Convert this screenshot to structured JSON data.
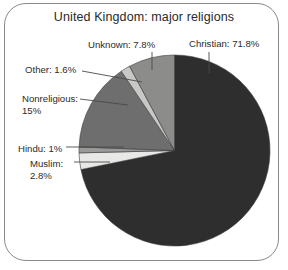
{
  "figure": {
    "frame": "rounded-rectangle-border",
    "background_color": "#ffffff",
    "border_color": "#8a8a86"
  },
  "chart_data": {
    "type": "pie",
    "title": "United Kingdom: major religions",
    "subtitle": "",
    "xlabel": "",
    "ylabel": "",
    "unit": "%",
    "total": 100,
    "start_angle_deg": 0,
    "direction": "clockwise",
    "legend_position": "none-labels-with-leader-lines",
    "grid": false,
    "categories": [
      "Christian",
      "Muslim",
      "Hindu",
      "Nonreligious",
      "Other",
      "Unknown"
    ],
    "values": [
      71.8,
      2.8,
      1,
      15,
      1.6,
      7.8
    ],
    "labels": [
      "Christian: 71.8%",
      "Muslim: 2.8%",
      "Hindu: 1%",
      "Nonreligious: 15%",
      "Other: 1.6%",
      "Unknown: 7.8%"
    ],
    "colors": [
      "#2e2e2e",
      "#e8e8e6",
      "#9a9a98",
      "#6e6e6e",
      "#c8c8c6",
      "#8c8c8a"
    ],
    "slices": [
      {
        "name": "Christian",
        "value": 71.8,
        "color": "#2e2e2e"
      },
      {
        "name": "Muslim",
        "value": 2.8,
        "color": "#e8e8e6"
      },
      {
        "name": "Hindu",
        "value": 1,
        "color": "#9a9a98"
      },
      {
        "name": "Nonreligious",
        "value": 15,
        "color": "#6e6e6e"
      },
      {
        "name": "Other",
        "value": 1.6,
        "color": "#c8c8c6"
      },
      {
        "name": "Unknown",
        "value": 7.8,
        "color": "#8c8c8a"
      }
    ]
  },
  "annotations": {
    "christian": "Christian: 71.8%",
    "unknown": "Unknown: 7.8%",
    "other": "Other: 1.6%",
    "nonreligious_line1": "Nonreligious:",
    "nonreligious_line2": "15%",
    "hindu": "Hindu: 1%",
    "muslim_line1": "Muslim:",
    "muslim_line2": "2.8%"
  }
}
